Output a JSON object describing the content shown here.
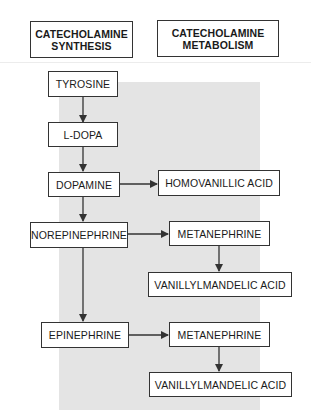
{
  "headers": {
    "synthesis_line1": "CATECHOLAMINE",
    "synthesis_line2": "SYNTHESIS",
    "metabolism_line1": "CATECHOLAMINE",
    "metabolism_line2": "METABOLISM"
  },
  "synthesis": {
    "tyrosine": "TYROSINE",
    "ldopa": "L-DOPA",
    "dopamine": "DOPAMINE",
    "norepinephrine": "NOREPINEPHRINE",
    "epinephrine": "EPINEPHRINE"
  },
  "metabolism": {
    "homovanillic_acid": "HOMOVANILLIC ACID",
    "metanephrine_1": "METANEPHRINE",
    "vma_1": "VANILLYLMANDELIC ACID",
    "metanephrine_2": "METANEPHRINE",
    "vma_2": "VANILLYLMANDELIC ACID"
  },
  "colors": {
    "panel": "#e4e4e4",
    "border": "#333333",
    "arrow": "#333333"
  }
}
